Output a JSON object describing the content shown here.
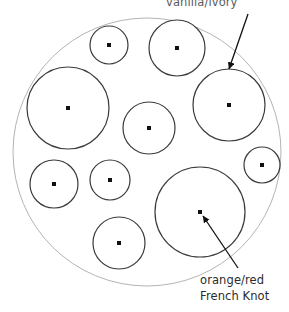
{
  "canvas": {
    "width": 289,
    "height": 312,
    "background": "#ffffff"
  },
  "title_visible": false,
  "annotations": {
    "top": {
      "text": "vanilla/ivory",
      "color": "#5a5a5a",
      "note": "clipped at top edge of image",
      "arrow": {
        "from_x": 248,
        "from_y": 14,
        "to_x": 229,
        "to_y": 69
      }
    },
    "bottom": {
      "line1": "orange/red",
      "line2": "French Knot",
      "color": "#2b2b2b",
      "arrow": {
        "from_x": 238,
        "from_y": 268,
        "to_x": 203,
        "to_y": 216
      }
    }
  },
  "outer_circle": {
    "name": "hoop-outline",
    "cx": 147,
    "cy": 152,
    "r": 134,
    "stroke": "#b8b4b0",
    "stroke_width": 1,
    "fill": "#ffffff"
  },
  "knots": [
    {
      "id": "knot-1",
      "cx": 109,
      "cy": 45,
      "r": 19,
      "dot_r": 2.0
    },
    {
      "id": "knot-2",
      "cx": 177,
      "cy": 48,
      "r": 28,
      "dot_r": 2.0
    },
    {
      "id": "knot-3",
      "cx": 229,
      "cy": 105,
      "r": 36,
      "dot_r": 2.0
    },
    {
      "id": "knot-4",
      "cx": 68,
      "cy": 108,
      "r": 41,
      "dot_r": 2.0
    },
    {
      "id": "knot-5",
      "cx": 149,
      "cy": 128,
      "r": 26,
      "dot_r": 2.0
    },
    {
      "id": "knot-6",
      "cx": 262,
      "cy": 165,
      "r": 18,
      "dot_r": 2.0
    },
    {
      "id": "knot-7",
      "cx": 54,
      "cy": 184,
      "r": 24,
      "dot_r": 2.0
    },
    {
      "id": "knot-8",
      "cx": 110,
      "cy": 180,
      "r": 20,
      "dot_r": 2.0
    },
    {
      "id": "knot-9",
      "cx": 200,
      "cy": 212,
      "r": 45,
      "dot_r": 2.0
    },
    {
      "id": "knot-10",
      "cx": 119,
      "cy": 243,
      "r": 26,
      "dot_r": 2.0
    }
  ],
  "knot_style": {
    "stroke": "#3a3a3a",
    "stroke_width": 1.2,
    "fill": "#ffffff",
    "dot_fill": "#111111"
  },
  "arrow_style": {
    "stroke": "#111111",
    "stroke_width": 1.3
  }
}
